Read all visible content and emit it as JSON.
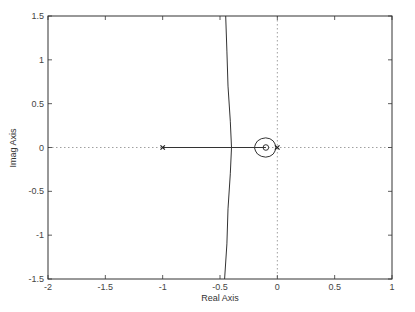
{
  "chart_data": {
    "type": "line",
    "subtype": "root-locus",
    "title": "",
    "xlabel": "Real Axis",
    "ylabel": "Imag Axis",
    "xlim": [
      -2,
      1
    ],
    "ylim": [
      -1.5,
      1.5
    ],
    "xticks": [
      -2,
      -1.5,
      -1,
      -0.5,
      0,
      0.5,
      1
    ],
    "xtick_labels": [
      "-2",
      "-1.5",
      "-1",
      "-0.5",
      "0",
      "0.5",
      "1"
    ],
    "yticks": [
      -1.5,
      -1,
      -0.5,
      0,
      0.5,
      1,
      1.5
    ],
    "ytick_labels": [
      "-1.5",
      "-1",
      "-0.5",
      "0",
      "0.5",
      "1",
      "1.5"
    ],
    "grid": false,
    "zero_lines": {
      "x0": true,
      "y0": true,
      "style": "dotted"
    },
    "poles": [
      {
        "re": -1,
        "im": 0,
        "marker": "x"
      },
      {
        "re": 0,
        "im": 0,
        "marker": "x"
      }
    ],
    "zeros": [
      {
        "re": -0.1,
        "im": 0,
        "marker": "o"
      }
    ],
    "series": [
      {
        "name": "real-axis-branch",
        "points": [
          [
            -1,
            0
          ],
          [
            -0.1,
            0
          ]
        ]
      },
      {
        "name": "upper-asymptote-branch",
        "points": [
          [
            -0.4,
            0
          ],
          [
            -0.41,
            0.3
          ],
          [
            -0.43,
            0.7
          ],
          [
            -0.44,
            1.1
          ],
          [
            -0.45,
            1.5
          ]
        ]
      },
      {
        "name": "lower-asymptote-branch",
        "points": [
          [
            -0.4,
            0
          ],
          [
            -0.41,
            -0.3
          ],
          [
            -0.43,
            -0.7
          ],
          [
            -0.44,
            -1.1
          ],
          [
            -0.46,
            -1.5
          ]
        ]
      },
      {
        "name": "loop-around-zero",
        "points": [
          [
            -0.2,
            0
          ],
          [
            -0.18,
            0.08
          ],
          [
            -0.1,
            0.12
          ],
          [
            -0.03,
            0.08
          ],
          [
            -0.01,
            0
          ],
          [
            -0.03,
            -0.08
          ],
          [
            -0.1,
            -0.12
          ],
          [
            -0.18,
            -0.08
          ],
          [
            -0.2,
            0
          ]
        ]
      }
    ],
    "legend": null
  }
}
